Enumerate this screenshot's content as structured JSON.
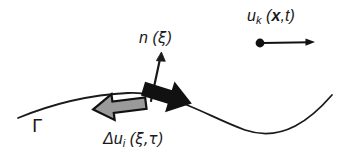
{
  "figure": {
    "background_color": "#ffffff",
    "ink_color": "#1a1a1a",
    "gray_arrow_fill": "#9a9a9a",
    "black_arrow_fill": "#111111",
    "width": 340,
    "height": 163
  },
  "labels": {
    "normal_vector": {
      "symbol": "n",
      "arg_open": " (",
      "arg": "ξ",
      "arg_close": ")",
      "full_text": "n (ξ)"
    },
    "surface": {
      "symbol": "Γ",
      "full_text": "Γ"
    },
    "slip": {
      "prefix": "Δu",
      "subscript": "i",
      "arg_open": " (",
      "arg": "ξ,τ",
      "arg_close": ")",
      "full_text": "Δu_i (ξ,τ)"
    },
    "displacement_field": {
      "prefix": "u",
      "subscript": "k",
      "arg_open": " (",
      "arg_vector": "x",
      "arg_rest": ",t",
      "arg_close": ")",
      "full_text": "u_k (x,t)"
    }
  },
  "graphics": {
    "surface_curve": {
      "name": "fault-surface-curve",
      "path": "M 18 118 C 52 104, 86 95, 128 93 C 172 91, 206 116, 245 130 C 283 143, 312 118, 332 95",
      "stroke_width": 1.8
    },
    "normal_arrow": {
      "name": "normal-vector-arrow",
      "from": [
        151,
        101
      ],
      "to": [
        161,
        54
      ],
      "stroke_width": 2.2
    },
    "slip_arrow_left": {
      "name": "slip-arrow-negative-side",
      "direction": "left",
      "fill": "#9a9a9a",
      "stroke": "#111111"
    },
    "slip_arrow_right": {
      "name": "slip-arrow-positive-side",
      "direction": "right",
      "fill": "#111111",
      "stroke": "#111111"
    },
    "observer_arrow": {
      "name": "observation-point-arrow",
      "dot_center": [
        260,
        43
      ],
      "dot_radius": 4.2,
      "from": [
        262,
        43
      ],
      "to": [
        314,
        42
      ],
      "stroke_width": 1.8
    }
  }
}
